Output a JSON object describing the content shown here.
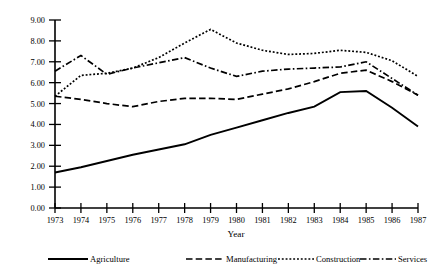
{
  "chart_data": {
    "type": "line",
    "title": "",
    "xlabel": "Year",
    "ylabel": "",
    "x": [
      1973,
      1974,
      1975,
      1976,
      1977,
      1978,
      1979,
      1980,
      1981,
      1982,
      1983,
      1984,
      1985,
      1986,
      1987
    ],
    "xtick_labels": [
      "1973",
      "1974",
      "1975",
      "1976",
      "1977",
      "1978",
      "1979",
      "1980",
      "1981",
      "1982",
      "1983",
      "1984",
      "1985",
      "1986",
      "1987"
    ],
    "ytick_labels": [
      "0.00",
      "1.00",
      "2.00",
      "3.00",
      "4.00",
      "5.00",
      "6.00",
      "7.00",
      "8.00",
      "9.00"
    ],
    "yticks": [
      0,
      1,
      2,
      3,
      4,
      5,
      6,
      7,
      8,
      9
    ],
    "ylim": [
      0,
      9
    ],
    "xlim": [
      1973,
      1987
    ],
    "grid": false,
    "legend_position": "bottom",
    "series": [
      {
        "name": "Agriculture",
        "style": "solid",
        "values": [
          1.7,
          1.95,
          2.25,
          2.55,
          2.8,
          3.05,
          3.5,
          3.85,
          4.2,
          4.55,
          4.85,
          5.55,
          5.6,
          4.8,
          3.9
        ]
      },
      {
        "name": "Manufacturing",
        "style": "dashed",
        "values": [
          5.35,
          5.2,
          5.0,
          4.85,
          5.1,
          5.25,
          5.25,
          5.2,
          5.45,
          5.7,
          6.05,
          6.45,
          6.6,
          6.05,
          5.4
        ]
      },
      {
        "name": "Construction",
        "style": "dotted",
        "values": [
          5.35,
          6.35,
          6.45,
          6.7,
          7.2,
          7.9,
          8.55,
          7.9,
          7.55,
          7.35,
          7.4,
          7.55,
          7.45,
          7.05,
          6.3
        ]
      },
      {
        "name": "Services",
        "style": "dash-dot",
        "values": [
          6.55,
          7.3,
          6.4,
          6.7,
          6.95,
          7.2,
          6.7,
          6.3,
          6.55,
          6.65,
          6.7,
          6.75,
          7.0,
          6.2,
          5.4
        ]
      }
    ]
  },
  "axes": {
    "x_axis_title": "Year"
  },
  "legend": {
    "items": [
      {
        "label": "Agriculture"
      },
      {
        "label": "Manufacturing"
      },
      {
        "label": "Construction"
      },
      {
        "label": "Services"
      }
    ]
  },
  "colors": {
    "ink": "#000000",
    "background": "#ffffff"
  }
}
